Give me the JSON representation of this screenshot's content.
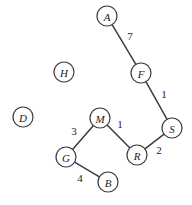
{
  "figure": {
    "title": "",
    "background_color": "#ffffff",
    "stroke_color": "#3c3c42",
    "node_fill_color": "#ffffff",
    "text_color": "#1c1c20"
  },
  "graph_data": {
    "type": "node-link-graph",
    "directed": false,
    "weighted": true,
    "node_radius": 10,
    "nodes": [
      {
        "id": "A",
        "label": "A",
        "x": 107,
        "y": 16
      },
      {
        "id": "H",
        "label": "H",
        "x": 64,
        "y": 72
      },
      {
        "id": "F",
        "label": "F",
        "x": 141,
        "y": 73
      },
      {
        "id": "D",
        "label": "D",
        "x": 23,
        "y": 117
      },
      {
        "id": "M",
        "label": "M",
        "x": 100,
        "y": 118
      },
      {
        "id": "S",
        "label": "S",
        "x": 172,
        "y": 128
      },
      {
        "id": "G",
        "label": "G",
        "x": 66,
        "y": 157
      },
      {
        "id": "R",
        "label": "R",
        "x": 137,
        "y": 155
      },
      {
        "id": "B",
        "label": "B",
        "x": 108,
        "y": 182
      }
    ],
    "edges": [
      {
        "source": "A",
        "target": "F",
        "weight": "7",
        "label_x": 130,
        "label_y": 36
      },
      {
        "source": "F",
        "target": "S",
        "weight": "1",
        "label_x": 164,
        "label_y": 94
      },
      {
        "source": "S",
        "target": "R",
        "weight": "2",
        "label_x": 159,
        "label_y": 150
      },
      {
        "source": "M",
        "target": "R",
        "weight": "1",
        "label_x": 120,
        "label_y": 124
      },
      {
        "source": "M",
        "target": "G",
        "weight": "3",
        "label_x": 74,
        "label_y": 131
      },
      {
        "source": "G",
        "target": "B",
        "weight": "4",
        "label_x": 80,
        "label_y": 178
      }
    ],
    "isolated_nodes": [
      "H",
      "D"
    ]
  }
}
